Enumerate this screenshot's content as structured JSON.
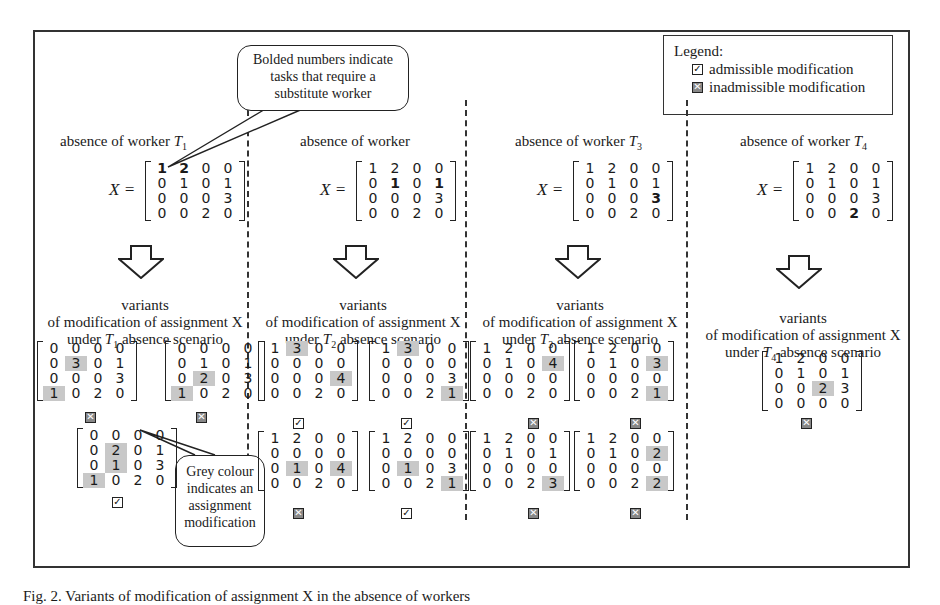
{
  "callouts": {
    "bold": [
      "Bolded numbers indicate",
      "tasks that require a",
      "substitute worker"
    ],
    "grey": [
      "Grey colour",
      "indicates an",
      "assignment",
      "modification"
    ]
  },
  "legend": {
    "title": "Legend:",
    "admissible": "admissible modification",
    "inadmissible": "inadmissible modification"
  },
  "columns": [
    {
      "header": "absence of worker",
      "worker": "T",
      "sub": "1",
      "label": "X =",
      "matrix": [
        [
          "1b",
          "2b",
          "0",
          "0"
        ],
        [
          "0",
          "1",
          "0",
          "1"
        ],
        [
          "0",
          "0",
          "0",
          "3"
        ],
        [
          "0",
          "0",
          "2",
          "0"
        ]
      ],
      "variants_line1": "variants",
      "variants_line2": "of modification of assignment X",
      "variants_line3_pre": "under",
      "variants_line3_post": "absence scenario",
      "variants": [
        {
          "matrix": [
            [
              "0",
              "0",
              "0",
              "0"
            ],
            [
              "0",
              "3g",
              "0",
              "1"
            ],
            [
              "0",
              "0",
              "0",
              "3"
            ],
            [
              "1g",
              "0",
              "2",
              "0"
            ]
          ],
          "status": "inadmissible"
        },
        {
          "matrix": [
            [
              "0",
              "0",
              "0",
              "0"
            ],
            [
              "0",
              "1",
              "0",
              "1"
            ],
            [
              "0",
              "2g",
              "0",
              "3"
            ],
            [
              "1g",
              "0",
              "2",
              "0"
            ]
          ],
          "status": "inadmissible"
        },
        {
          "matrix": [
            [
              "0",
              "0",
              "0",
              "0"
            ],
            [
              "0",
              "2g",
              "0",
              "1"
            ],
            [
              "0",
              "1g",
              "0",
              "3"
            ],
            [
              "1g",
              "0",
              "2",
              "0"
            ]
          ],
          "status": "admissible"
        }
      ]
    },
    {
      "header": "absence   of   worker",
      "worker": "",
      "sub": "",
      "label": "X =",
      "matrix": [
        [
          "1",
          "2",
          "0",
          "0"
        ],
        [
          "0",
          "1b",
          "0",
          "1b"
        ],
        [
          "0",
          "0",
          "0",
          "3"
        ],
        [
          "0",
          "0",
          "2",
          "0"
        ]
      ],
      "variants_line1": "variants",
      "variants_line2": "of modification of assignment X",
      "variants_line3_pre": "under",
      "variants_line3_worker": "T",
      "variants_line3_sub": "2",
      "variants_line3_post": "absence scenario",
      "variants": [
        {
          "matrix": [
            [
              "1",
              "3g",
              "0",
              "0"
            ],
            [
              "0",
              "0",
              "0",
              "0"
            ],
            [
              "0",
              "0",
              "0",
              "4g"
            ],
            [
              "0",
              "0",
              "2",
              "0"
            ]
          ],
          "status": "admissible"
        },
        {
          "matrix": [
            [
              "1",
              "3g",
              "0",
              "0"
            ],
            [
              "0",
              "0",
              "0",
              "0"
            ],
            [
              "0",
              "0",
              "0",
              "3"
            ],
            [
              "0",
              "0",
              "2",
              "1g"
            ]
          ],
          "status": "admissible"
        },
        {
          "matrix": [
            [
              "1",
              "2",
              "0",
              "0"
            ],
            [
              "0",
              "0",
              "0",
              "0"
            ],
            [
              "0",
              "1g",
              "0",
              "4g"
            ],
            [
              "0",
              "0",
              "2",
              "0"
            ]
          ],
          "status": "inadmissible"
        },
        {
          "matrix": [
            [
              "1",
              "2",
              "0",
              "0"
            ],
            [
              "0",
              "0",
              "0",
              "0"
            ],
            [
              "0",
              "1g",
              "0",
              "3"
            ],
            [
              "0",
              "0",
              "2",
              "1g"
            ]
          ],
          "status": "admissible"
        }
      ]
    },
    {
      "header": "absence of worker",
      "worker": "T",
      "sub": "3",
      "label": "X =",
      "matrix": [
        [
          "1",
          "2",
          "0",
          "0"
        ],
        [
          "0",
          "1",
          "0",
          "1"
        ],
        [
          "0",
          "0",
          "0",
          "3b"
        ],
        [
          "0",
          "0",
          "2",
          "0"
        ]
      ],
      "variants_line1": "variants",
      "variants_line2": "of modification of assignment X",
      "variants_line3_pre": "under",
      "variants_line3_post": "absence scenario",
      "variants": [
        {
          "matrix": [
            [
              "1",
              "2",
              "0",
              "0"
            ],
            [
              "0",
              "1",
              "0",
              "4g"
            ],
            [
              "0",
              "0",
              "0",
              "0"
            ],
            [
              "0",
              "0",
              "2",
              "0"
            ]
          ],
          "status": "inadmissible"
        },
        {
          "matrix": [
            [
              "1",
              "2",
              "0",
              "0"
            ],
            [
              "0",
              "1",
              "0",
              "3g"
            ],
            [
              "0",
              "0",
              "0",
              "0"
            ],
            [
              "0",
              "0",
              "2",
              "1g"
            ]
          ],
          "status": "inadmissible"
        },
        {
          "matrix": [
            [
              "1",
              "2",
              "0",
              "0"
            ],
            [
              "0",
              "1",
              "0",
              "1"
            ],
            [
              "0",
              "0",
              "0",
              "0"
            ],
            [
              "0",
              "0",
              "2",
              "3g"
            ]
          ],
          "status": "inadmissible"
        },
        {
          "matrix": [
            [
              "1",
              "2",
              "0",
              "0"
            ],
            [
              "0",
              "1",
              "0",
              "2g"
            ],
            [
              "0",
              "0",
              "0",
              "0"
            ],
            [
              "0",
              "0",
              "2",
              "2g"
            ]
          ],
          "status": "inadmissible"
        }
      ]
    },
    {
      "header": "absence of worker",
      "worker": "T",
      "sub": "4",
      "label": "X =",
      "matrix": [
        [
          "1",
          "2",
          "0",
          "0"
        ],
        [
          "0",
          "1",
          "0",
          "1"
        ],
        [
          "0",
          "0",
          "0",
          "3"
        ],
        [
          "0",
          "0",
          "2b",
          "0"
        ]
      ],
      "variants_line1": "variants",
      "variants_line2": "of modification of assignment X",
      "variants_line3_pre": "under",
      "variants_line3_post": "absence scenario",
      "variants": [
        {
          "matrix": [
            [
              "1",
              "2",
              "0",
              "0"
            ],
            [
              "0",
              "1",
              "0",
              "1"
            ],
            [
              "0",
              "0",
              "2g",
              "3"
            ],
            [
              "0",
              "0",
              "0",
              "0"
            ]
          ],
          "status": "inadmissible"
        }
      ]
    }
  ],
  "caption": "Fig. 2.  Variants of modification of assignment X in the absence of workers"
}
